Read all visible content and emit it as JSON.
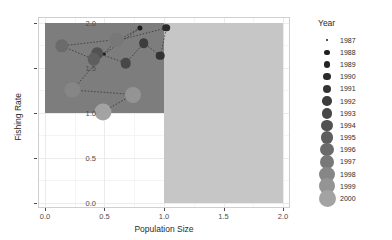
{
  "chart_data": {
    "type": "scatter",
    "title": "",
    "xlabel": "Population Size",
    "ylabel": "Fishing Rate",
    "xlim": [
      -0.05,
      2.05
    ],
    "ylim": [
      -0.05,
      2.05
    ],
    "xticks": [
      "0.0",
      "0.5",
      "1.0",
      "1.5",
      "2.0"
    ],
    "xtick_values": [
      0.0,
      0.5,
      1.0,
      1.5,
      2.0
    ],
    "yticks": [
      "0.0",
      "0.5",
      "1.0",
      "1.5",
      "2.0"
    ],
    "ytick_values": [
      0.0,
      0.5,
      1.0,
      1.5,
      2.0
    ],
    "grid": true,
    "legend_position": "right",
    "legend_title": "Year",
    "series_name": "Year",
    "connected": true,
    "path_style": "dotted",
    "x": [
      0.5,
      0.8,
      0.61,
      1.02,
      0.97,
      0.83,
      0.68,
      0.44,
      0.41,
      0.14,
      0.6,
      0.23,
      0.74,
      0.49
    ],
    "y": [
      1.65,
      1.94,
      1.8,
      1.94,
      1.63,
      1.77,
      1.55,
      1.66,
      1.59,
      1.74,
      1.81,
      1.25,
      1.2,
      1.01
    ],
    "points": [
      {
        "year": "1987",
        "x": 0.5,
        "y": 1.65,
        "size": 1.4,
        "color": "#191919"
      },
      {
        "year": "1988",
        "x": 0.8,
        "y": 1.94,
        "size": 2.6,
        "color": "#1f1f1f"
      },
      {
        "year": "1989",
        "x": 0.61,
        "y": 1.8,
        "size": 3.2,
        "color": "#242424"
      },
      {
        "year": "1990",
        "x": 1.02,
        "y": 1.94,
        "size": 3.8,
        "color": "#2b2b2b"
      },
      {
        "year": "1991",
        "x": 0.97,
        "y": 1.63,
        "size": 4.3,
        "color": "#333333"
      },
      {
        "year": "1992",
        "x": 0.83,
        "y": 1.77,
        "size": 4.8,
        "color": "#3d3d3d"
      },
      {
        "year": "1993",
        "x": 0.68,
        "y": 1.55,
        "size": 5.3,
        "color": "#474747"
      },
      {
        "year": "1994",
        "x": 0.44,
        "y": 1.66,
        "size": 5.8,
        "color": "#525252"
      },
      {
        "year": "1995",
        "x": 0.41,
        "y": 1.59,
        "size": 6.2,
        "color": "#5e5e5e"
      },
      {
        "year": "1996",
        "x": 0.14,
        "y": 1.74,
        "size": 6.7,
        "color": "#6b6b6b"
      },
      {
        "year": "1997",
        "x": 0.6,
        "y": 1.81,
        "size": 7.1,
        "color": "#787878"
      },
      {
        "year": "1998",
        "x": 0.23,
        "y": 1.25,
        "size": 7.6,
        "color": "#868686"
      },
      {
        "year": "1999",
        "x": 0.74,
        "y": 1.2,
        "size": 8.0,
        "color": "#949494"
      },
      {
        "year": "2000",
        "x": 0.49,
        "y": 1.01,
        "size": 8.5,
        "color": "#a3a3a3"
      }
    ],
    "regions": [
      {
        "name": "overfished-region",
        "x0": 0.0,
        "x1": 1.0,
        "y0": 1.0,
        "y1": 2.0,
        "color": "#7d7d7d"
      },
      {
        "name": "high-population-region",
        "x0": 1.0,
        "x1": 2.0,
        "y0": 0.0,
        "y1": 2.0,
        "color": "#c6c6c6"
      }
    ]
  },
  "legend": {
    "title": "Year",
    "entries": [
      {
        "label": "1987",
        "size": 1.4,
        "color": "#191919"
      },
      {
        "label": "1988",
        "size": 2.6,
        "color": "#1f1f1f"
      },
      {
        "label": "1989",
        "size": 3.2,
        "color": "#242424"
      },
      {
        "label": "1990",
        "size": 3.8,
        "color": "#2b2b2b"
      },
      {
        "label": "1991",
        "size": 4.3,
        "color": "#333333"
      },
      {
        "label": "1992",
        "size": 4.8,
        "color": "#3d3d3d"
      },
      {
        "label": "1993",
        "size": 5.3,
        "color": "#474747"
      },
      {
        "label": "1994",
        "size": 5.8,
        "color": "#525252"
      },
      {
        "label": "1995",
        "size": 6.2,
        "color": "#5e5e5e"
      },
      {
        "label": "1996",
        "size": 6.7,
        "color": "#6b6b6b"
      },
      {
        "label": "1997",
        "size": 7.1,
        "color": "#787878"
      },
      {
        "label": "1998",
        "size": 7.6,
        "color": "#868686"
      },
      {
        "label": "1999",
        "size": 8.0,
        "color": "#949494"
      },
      {
        "label": "2000",
        "size": 8.5,
        "color": "#a3a3a3"
      }
    ]
  },
  "theme": {
    "panel_background": "#ffffff",
    "grid_major": "#ebebeb",
    "grid_minor": "#f4f4f4",
    "text_color": "#2b2b2b",
    "tick_color": "#4d4d4d"
  }
}
